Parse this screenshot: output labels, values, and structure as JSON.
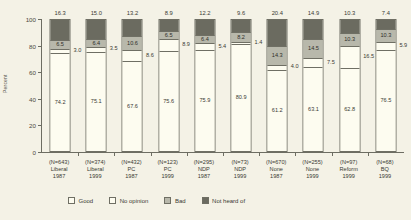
{
  "chart_data": {
    "type": "bar",
    "subtype": "stacked-percent",
    "title": "",
    "xlabel": "",
    "ylabel": "Percent",
    "ylim": [
      0,
      100
    ],
    "yticks": [
      0,
      20,
      40,
      60,
      80,
      100
    ],
    "grid": false,
    "legend_position": "bottom",
    "categories": [
      {
        "n": "(N=643)",
        "party": "Liberal",
        "year": "1987"
      },
      {
        "n": "(N=374)",
        "party": "Liberal",
        "year": "1999"
      },
      {
        "n": "(N=432)",
        "party": "PC",
        "year": "1987"
      },
      {
        "n": "(N=123)",
        "party": "PC",
        "year": "1999"
      },
      {
        "n": "(N=295)",
        "party": "NDP",
        "year": "1987"
      },
      {
        "n": "(N=73)",
        "party": "NDP",
        "year": "1999"
      },
      {
        "n": "(N=670)",
        "party": "None",
        "year": "1987"
      },
      {
        "n": "(N=255)",
        "party": "None",
        "year": "1999"
      },
      {
        "n": "(N=97)",
        "party": "Reform",
        "year": "1999"
      },
      {
        "n": "(N=68)",
        "party": "BQ",
        "year": "1999"
      }
    ],
    "series": [
      {
        "name": "Good",
        "color": "#fdfcf0",
        "values": [
          74.2,
          75.1,
          67.6,
          75.6,
          75.9,
          80.9,
          61.2,
          63.1,
          62.8,
          76.5
        ]
      },
      {
        "name": "No opinion",
        "color": "#fdfcf0",
        "values": [
          3.0,
          3.5,
          8.6,
          8.9,
          5.4,
          1.4,
          4.0,
          7.5,
          16.5,
          5.9
        ]
      },
      {
        "name": "Bad",
        "color": "#b8b8ab",
        "values": [
          6.5,
          6.4,
          10.6,
          6.5,
          6.4,
          8.2,
          14.3,
          14.5,
          10.3,
          10.3
        ]
      },
      {
        "name": "Not heard of",
        "color": "#6b6b60",
        "values": [
          16.3,
          15.0,
          13.2,
          8.9,
          12.2,
          9.6,
          20.4,
          14.9,
          10.3,
          7.4
        ]
      }
    ]
  },
  "legend": {
    "items": [
      {
        "label": "Good"
      },
      {
        "label": "No opinion"
      },
      {
        "label": "Bad"
      },
      {
        "label": "Not heard of"
      }
    ]
  }
}
